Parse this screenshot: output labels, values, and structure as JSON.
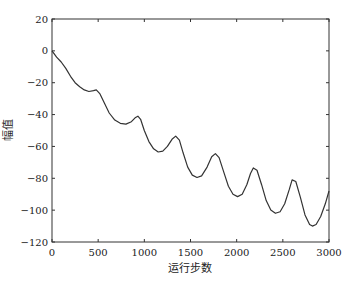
{
  "chart_data": {
    "type": "line",
    "title": "",
    "xlabel": "运行步数",
    "ylabel": "幅值",
    "xlim": [
      0,
      3000
    ],
    "ylim": [
      -120,
      20
    ],
    "xticks": [
      0,
      500,
      1000,
      1500,
      2000,
      2500,
      3000
    ],
    "yticks": [
      20,
      0,
      -20,
      -40,
      -60,
      -80,
      -100,
      -120
    ],
    "grid": false,
    "legend": null,
    "series": [
      {
        "name": "幅值",
        "color": "#333333",
        "x": [
          0,
          50,
          100,
          150,
          200,
          250,
          300,
          350,
          400,
          450,
          480,
          520,
          570,
          620,
          680,
          740,
          800,
          860,
          900,
          930,
          960,
          1000,
          1050,
          1100,
          1150,
          1200,
          1250,
          1300,
          1340,
          1380,
          1420,
          1470,
          1520,
          1570,
          1620,
          1680,
          1730,
          1770,
          1810,
          1860,
          1910,
          1960,
          2010,
          2060,
          2110,
          2150,
          2180,
          2220,
          2270,
          2320,
          2370,
          2420,
          2470,
          2520,
          2570,
          2600,
          2640,
          2690,
          2740,
          2790,
          2820,
          2860,
          2910,
          2960,
          3000
        ],
        "values": [
          0,
          -4,
          -7,
          -11,
          -16,
          -20,
          -22.5,
          -24.5,
          -25.5,
          -25,
          -24.5,
          -27,
          -33,
          -39,
          -43.5,
          -45.5,
          -46,
          -44.5,
          -42,
          -41,
          -43,
          -50,
          -57,
          -61.5,
          -63.5,
          -63,
          -60,
          -55.5,
          -53.5,
          -56,
          -64,
          -73,
          -78,
          -79.5,
          -78.5,
          -73,
          -66.5,
          -64.5,
          -67,
          -76,
          -85,
          -90,
          -91.5,
          -90,
          -84,
          -77,
          -73.5,
          -75,
          -84,
          -94,
          -100,
          -102,
          -101,
          -96,
          -87,
          -81,
          -82,
          -92,
          -103,
          -109,
          -110,
          -109,
          -104,
          -96,
          -88
        ]
      }
    ]
  }
}
